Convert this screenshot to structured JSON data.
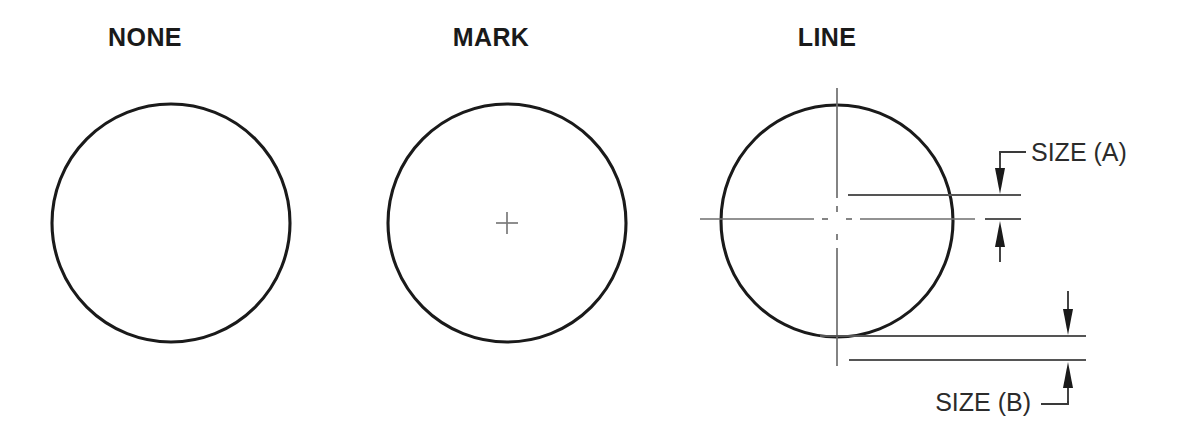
{
  "page": {
    "width": 1204,
    "height": 445,
    "background": "#ffffff",
    "kind": "engineering-drawing"
  },
  "colors": {
    "outline": "#1a1a1a",
    "centerline": "#6e6e6e",
    "extension_line": "#555555",
    "dimension": "#3a3a3a",
    "title_text": "#1a1a1a",
    "label_text": "#2b2b2b"
  },
  "figures": [
    {
      "id": "none",
      "title": "NONE",
      "title_x": 145,
      "title_y": 46,
      "circle": {
        "cx": 171,
        "cy": 223,
        "r": 119
      },
      "has_center_mark": false,
      "has_center_lines": false
    },
    {
      "id": "mark",
      "title": "MARK",
      "title_x": 491,
      "title_y": 46,
      "circle": {
        "cx": 507,
        "cy": 223,
        "r": 119
      },
      "has_center_mark": true,
      "has_center_lines": false,
      "center_mark": {
        "cx": 507,
        "cy": 223,
        "arm": 11
      }
    },
    {
      "id": "line",
      "title": "LINE",
      "title_x": 827,
      "title_y": 46,
      "circle": {
        "cx": 837,
        "cy": 221,
        "r": 116
      },
      "has_center_mark": false,
      "has_center_lines": true,
      "center_lines": {
        "vertical": {
          "x": 837,
          "y1": 88,
          "y2": 366
        },
        "horizontal": {
          "y": 219,
          "x1": 700,
          "x2": 975
        }
      }
    }
  ],
  "dimensions": [
    {
      "id": "size-a",
      "label": "SIZE (A)",
      "label_x": 1031,
      "label_y": 161,
      "extension_lines": [
        {
          "x1": 848,
          "y1": 195,
          "x2": 1021,
          "y2": 195
        },
        {
          "x1": 848,
          "y1": 219,
          "x2": 1021,
          "y2": 219
        }
      ],
      "arrow_x": 1000,
      "upper_arrow": {
        "tip_y": 193,
        "from_y": 155,
        "direction": "down"
      },
      "lower_arrow": {
        "tip_y": 221,
        "from_y": 262,
        "direction": "up"
      },
      "leader": {
        "corner_x": 1000,
        "corner_y": 152,
        "end_x": 1025,
        "end_y": 152
      }
    },
    {
      "id": "size-b",
      "label": "SIZE (B)",
      "label_x": 813,
      "label_y": 411,
      "extension_lines": [
        {
          "x1": 820,
          "y1": 336,
          "x2": 1086,
          "y2": 336
        },
        {
          "x1": 849,
          "y1": 360,
          "x2": 1086,
          "y2": 360
        }
      ],
      "arrow_x": 1068,
      "upper_arrow": {
        "tip_y": 334,
        "from_y": 291,
        "direction": "down"
      },
      "lower_arrow": {
        "tip_y": 362,
        "from_y": 404,
        "direction": "up"
      },
      "leader": {
        "corner_x": 1068,
        "corner_y": 404,
        "end_x": 1042,
        "end_y": 404
      }
    }
  ]
}
